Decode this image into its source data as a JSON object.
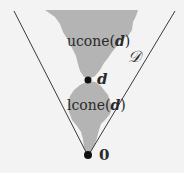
{
  "diagram": {
    "labels": {
      "ucone_prefix": "ucone(",
      "ucone_var": "d",
      "ucone_suffix": ")",
      "lcone_prefix": "lcone(",
      "lcone_var": "d",
      "lcone_suffix": ")",
      "point_d": "d",
      "point_zero": "0",
      "domain": "𝒟"
    },
    "colors": {
      "background": "#f3f3f3",
      "region_fill": "#b4b4b4",
      "lines": "#3a3a3a",
      "points": "#111111"
    }
  }
}
